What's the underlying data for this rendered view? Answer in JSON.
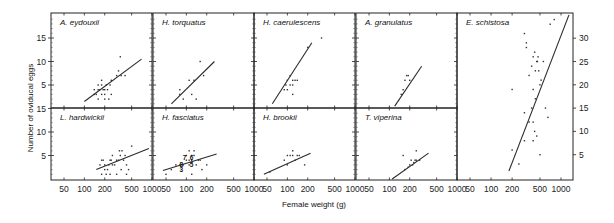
{
  "chart_data": {
    "type": "scatter",
    "title": "",
    "xlabel": "Female weight (g)",
    "ylabel": "Number of oviducal eggs",
    "x_scale": "log",
    "x_ticks": [
      50,
      100,
      200,
      500,
      1000
    ],
    "x_tick_labels": [
      "50",
      "100",
      "200",
      "500",
      "1000"
    ],
    "y_ticks_left": [
      5,
      10,
      15
    ],
    "y_ticks_right": [
      5,
      10,
      15,
      20,
      25,
      30
    ],
    "ylim_small_panels": [
      0,
      15
    ],
    "ylim_e_schistosa": [
      0,
      35
    ],
    "grid": false,
    "panels": [
      {
        "name": "A. eydouxii",
        "row": 1,
        "col": 1,
        "points": [
          [
            150,
            3
          ],
          [
            160,
            4
          ],
          [
            170,
            4
          ],
          [
            180,
            3
          ],
          [
            190,
            4
          ],
          [
            200,
            4
          ],
          [
            210,
            5
          ],
          [
            220,
            4
          ],
          [
            180,
            5
          ],
          [
            200,
            3
          ],
          [
            140,
            4
          ],
          [
            160,
            5
          ],
          [
            240,
            5
          ],
          [
            250,
            6
          ],
          [
            300,
            7
          ],
          [
            320,
            8
          ],
          [
            180,
            6
          ],
          [
            200,
            2
          ],
          [
            230,
            2
          ],
          [
            160,
            2
          ],
          [
            140,
            3
          ],
          [
            250,
            3
          ],
          [
            350,
            7
          ],
          [
            400,
            7
          ],
          [
            340,
            11
          ]
        ],
        "fit": [
          [
            100,
            1.5
          ],
          [
            700,
            10.5
          ]
        ]
      },
      {
        "name": "H. torquatus",
        "row": 1,
        "col": 2,
        "points": [
          [
            80,
            3
          ],
          [
            80,
            4
          ],
          [
            90,
            2
          ],
          [
            120,
            3
          ],
          [
            140,
            2
          ],
          [
            130,
            6
          ],
          [
            160,
            10
          ],
          [
            180,
            7
          ],
          [
            110,
            6
          ]
        ],
        "fit": [
          [
            60,
            1
          ],
          [
            260,
            10
          ]
        ]
      },
      {
        "name": "H. caerulescens",
        "row": 1,
        "col": 3,
        "points": [
          [
            90,
            4
          ],
          [
            95,
            5
          ],
          [
            100,
            6
          ],
          [
            100,
            4
          ],
          [
            110,
            5
          ],
          [
            110,
            7
          ],
          [
            120,
            6
          ],
          [
            120,
            5
          ],
          [
            130,
            6
          ],
          [
            140,
            6
          ],
          [
            120,
            3
          ],
          [
            200,
            13
          ],
          [
            320,
            15
          ]
        ],
        "fit": [
          [
            60,
            1
          ],
          [
            230,
            14
          ]
        ]
      },
      {
        "name": "A. granulatus",
        "row": 1,
        "col": 4,
        "points": [
          [
            150,
            3
          ],
          [
            160,
            4
          ],
          [
            170,
            6
          ],
          [
            180,
            7
          ],
          [
            190,
            7
          ],
          [
            200,
            6
          ]
        ],
        "fit": [
          [
            120,
            0.5
          ],
          [
            300,
            9
          ]
        ]
      },
      {
        "name": "L. hardwickii",
        "row": 2,
        "col": 1,
        "points": [
          [
            170,
            3
          ],
          [
            180,
            4
          ],
          [
            190,
            4
          ],
          [
            200,
            2
          ],
          [
            210,
            1
          ],
          [
            220,
            2
          ],
          [
            230,
            3
          ],
          [
            240,
            4
          ],
          [
            250,
            4
          ],
          [
            260,
            3
          ],
          [
            280,
            3
          ],
          [
            300,
            4
          ],
          [
            320,
            4
          ],
          [
            340,
            5
          ],
          [
            360,
            6
          ],
          [
            380,
            4
          ],
          [
            400,
            5
          ],
          [
            420,
            3
          ],
          [
            450,
            2
          ],
          [
            500,
            7
          ],
          [
            180,
            1
          ],
          [
            240,
            1
          ],
          [
            300,
            1
          ],
          [
            350,
            2
          ],
          [
            420,
            1
          ],
          [
            200,
            3
          ],
          [
            260,
            5
          ],
          [
            330,
            6
          ]
        ],
        "fit": [
          [
            150,
            2
          ],
          [
            900,
            6.5
          ]
        ]
      },
      {
        "name": "H. fasciatus",
        "row": 2,
        "col": 2,
        "points": [
          [
            50,
            1
          ],
          [
            60,
            2
          ],
          [
            70,
            3
          ],
          [
            80,
            3
          ],
          [
            90,
            3
          ],
          [
            100,
            4
          ],
          [
            100,
            5
          ],
          [
            110,
            3
          ],
          [
            110,
            4
          ],
          [
            120,
            4
          ],
          [
            120,
            5
          ],
          [
            130,
            5
          ],
          [
            140,
            3
          ],
          [
            150,
            4
          ],
          [
            160,
            4
          ],
          [
            170,
            2
          ],
          [
            200,
            3
          ],
          [
            110,
            6
          ],
          [
            130,
            6
          ],
          [
            120,
            1
          ]
        ],
        "annotations": [
          {
            "text": "7",
            "x": 95,
            "y": 4.5
          },
          {
            "text": "6",
            "x": 120,
            "y": 4.5
          },
          {
            "text": "8",
            "x": 85,
            "y": 3
          },
          {
            "text": "5",
            "x": 120,
            "y": 3
          },
          {
            "text": "3",
            "x": 85,
            "y": 2
          }
        ],
        "fit": [
          [
            45,
            1.8
          ],
          [
            280,
            5.3
          ]
        ]
      },
      {
        "name": "H. brookii",
        "row": 2,
        "col": 3,
        "points": [
          [
            55,
            1.5
          ],
          [
            90,
            4
          ],
          [
            100,
            5
          ],
          [
            100,
            3
          ],
          [
            110,
            5
          ],
          [
            120,
            6
          ],
          [
            120,
            5
          ],
          [
            130,
            4
          ],
          [
            140,
            5
          ],
          [
            150,
            5
          ],
          [
            180,
            3
          ]
        ],
        "fit": [
          [
            45,
            1
          ],
          [
            220,
            5.5
          ]
        ]
      },
      {
        "name": "T. viperina",
        "row": 2,
        "col": 4,
        "points": [
          [
            160,
            5
          ],
          [
            170,
            2
          ],
          [
            190,
            2.5
          ],
          [
            200,
            3
          ],
          [
            210,
            4
          ],
          [
            220,
            3
          ],
          [
            230,
            3.5
          ],
          [
            240,
            4
          ],
          [
            250,
            4
          ],
          [
            250,
            6
          ],
          [
            280,
            4
          ]
        ],
        "fit": [
          [
            110,
            0
          ],
          [
            380,
            5.5
          ]
        ]
      },
      {
        "name": "E. schistosa",
        "row": "1-2",
        "col": 5,
        "points": [
          [
            200,
            19
          ],
          [
            300,
            31
          ],
          [
            320,
            28
          ],
          [
            320,
            29
          ],
          [
            350,
            22
          ],
          [
            380,
            24
          ],
          [
            400,
            26
          ],
          [
            420,
            27
          ],
          [
            430,
            23
          ],
          [
            450,
            25
          ],
          [
            460,
            25
          ],
          [
            470,
            26
          ],
          [
            480,
            23
          ],
          [
            500,
            20
          ],
          [
            520,
            21
          ],
          [
            400,
            19
          ],
          [
            430,
            17
          ],
          [
            560,
            25
          ],
          [
            700,
            33
          ],
          [
            800,
            34
          ],
          [
            380,
            15
          ],
          [
            600,
            15
          ],
          [
            650,
            13
          ],
          [
            300,
            14
          ],
          [
            350,
            12
          ],
          [
            400,
            12
          ],
          [
            420,
            10
          ],
          [
            450,
            9
          ],
          [
            300,
            8
          ],
          [
            400,
            8
          ],
          [
            500,
            5
          ],
          [
            250,
            3
          ],
          [
            200,
            6
          ]
        ],
        "fit": [
          [
            180,
            1.5
          ],
          [
            1300,
            35
          ]
        ]
      }
    ]
  },
  "labels": {
    "xlabel": "Female weight (g)",
    "ylabel": "Number of oviducal eggs"
  }
}
